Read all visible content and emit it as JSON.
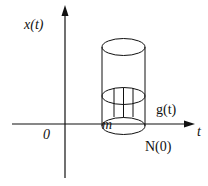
{
  "diagram": {
    "type": "axes-with-cylinder",
    "colors": {
      "stroke": "#111111",
      "background": "#ffffff"
    },
    "labels": {
      "y_axis": "x(t)",
      "x_axis": "t",
      "origin": "0",
      "mass": "m",
      "curve": "g(t)",
      "base_point": "N(0)"
    },
    "elements": [
      "vertical axis with arrow labeled x(t)",
      "horizontal axis with arrow labeled t",
      "origin label 0",
      "cylinder standing on horizontal axis",
      "middle cross-section ellipse with vertical hatching lines",
      "label m on base ellipse",
      "label g(t) above axis right of cylinder",
      "label N(0) below base"
    ]
  }
}
